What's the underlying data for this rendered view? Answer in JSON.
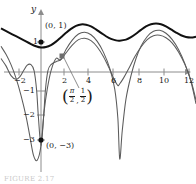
{
  "figure": {
    "caption": "FIGURE 2.17"
  },
  "axes": {
    "y_axis_name": "y",
    "x_ticks": [
      {
        "value": -2,
        "label": "−2",
        "px": 19
      },
      {
        "value": 2,
        "label": "2",
        "px": 64
      },
      {
        "value": 4,
        "label": "4",
        "px": 88
      },
      {
        "value": 6,
        "label": "6",
        "px": 113
      },
      {
        "value": 8,
        "label": "8",
        "px": 139
      },
      {
        "value": 10,
        "label": "10",
        "px": 164
      },
      {
        "value": 12,
        "label": "12",
        "px": 189
      }
    ],
    "y_ticks": [
      {
        "value": 1,
        "label": "1",
        "px": 42
      },
      {
        "value": -1,
        "label": "−1",
        "px": 91
      },
      {
        "value": -2,
        "label": "−2",
        "px": 115
      },
      {
        "value": -3,
        "label": "−3",
        "px": 140
      }
    ],
    "x_axis_y_px": 72,
    "y_axis_x_px": 41
  },
  "annotations": {
    "point_top": {
      "label": "(0, 1)",
      "marker": "filled-circle",
      "x_px": 41,
      "y_px": 42
    },
    "point_bottom": {
      "label": "(0, −3)",
      "marker": "filled-circle",
      "x_px": 41,
      "y_px": 140
    },
    "point_mid": {
      "marker": "filled-square",
      "x_px": 62,
      "y_px": 56,
      "x_num": "π",
      "x_den": "2",
      "y_num": "1",
      "y_den": "2"
    }
  },
  "colors": {
    "curve_thick": "#111111",
    "curve_thin": "#5b5b5b",
    "axis": "#8c8c8c",
    "text": "#1a1a1a"
  },
  "chart_data": {
    "type": "line",
    "title": "",
    "xlabel": "",
    "ylabel": "y",
    "xlim": [
      -3.2,
      12.4
    ],
    "ylim": [
      -3.6,
      2.4
    ],
    "grid": false,
    "legend": null,
    "series": [
      {
        "name": "upper-bounded-oscillating-curve",
        "style": "thick-black",
        "points": [
          [
            -3.2,
            1.78
          ],
          [
            -2.6,
            1.62
          ],
          [
            -2.0,
            1.46
          ],
          [
            -1.4,
            1.3
          ],
          [
            -0.8,
            1.14
          ],
          [
            -0.4,
            1.05
          ],
          [
            0.0,
            1.0
          ],
          [
            0.4,
            1.02
          ],
          [
            0.8,
            1.1
          ],
          [
            1.2,
            1.24
          ],
          [
            1.6,
            1.42
          ],
          [
            2.0,
            1.6
          ],
          [
            2.4,
            1.76
          ],
          [
            2.8,
            1.88
          ],
          [
            3.2,
            1.94
          ],
          [
            3.6,
            1.93
          ],
          [
            4.0,
            1.86
          ],
          [
            4.4,
            1.74
          ],
          [
            4.8,
            1.6
          ],
          [
            5.2,
            1.46
          ],
          [
            5.6,
            1.35
          ],
          [
            6.0,
            1.29
          ],
          [
            6.3,
            1.28
          ],
          [
            6.8,
            1.32
          ],
          [
            7.2,
            1.42
          ],
          [
            7.6,
            1.56
          ],
          [
            8.0,
            1.72
          ],
          [
            8.4,
            1.86
          ],
          [
            8.8,
            1.95
          ],
          [
            9.2,
            1.98
          ],
          [
            9.6,
            1.95
          ],
          [
            10.0,
            1.86
          ],
          [
            10.4,
            1.74
          ],
          [
            10.8,
            1.61
          ],
          [
            11.2,
            1.5
          ],
          [
            11.6,
            1.43
          ],
          [
            12.0,
            1.41
          ],
          [
            12.4,
            1.44
          ]
        ]
      },
      {
        "name": "middle-spiking-curve",
        "style": "thin-gray",
        "points": [
          [
            -3.2,
            1.05
          ],
          [
            -2.8,
            0.72
          ],
          [
            -2.4,
            0.3
          ],
          [
            -2.0,
            -0.25
          ],
          [
            -1.6,
            -0.95
          ],
          [
            -1.2,
            -1.8
          ],
          [
            -0.9,
            -2.6
          ],
          [
            -0.6,
            -3.4
          ],
          [
            -0.3,
            -3.6
          ],
          [
            0.0,
            -3.0
          ],
          [
            0.25,
            -1.6
          ],
          [
            0.5,
            -0.7
          ],
          [
            0.8,
            0.05
          ],
          [
            1.2,
            0.55
          ],
          [
            1.57,
            0.5
          ],
          [
            2.0,
            0.92
          ],
          [
            2.5,
            1.3
          ],
          [
            3.0,
            1.55
          ],
          [
            3.5,
            1.62
          ],
          [
            4.0,
            1.52
          ],
          [
            4.5,
            1.25
          ],
          [
            5.0,
            0.8
          ],
          [
            5.5,
            0.15
          ],
          [
            5.9,
            -0.7
          ],
          [
            6.15,
            -1.9
          ],
          [
            6.3,
            -3.55
          ],
          [
            6.5,
            -2.4
          ],
          [
            6.8,
            -1.1
          ],
          [
            7.2,
            -0.15
          ],
          [
            7.6,
            0.55
          ],
          [
            8.0,
            1.05
          ],
          [
            8.5,
            1.45
          ],
          [
            9.0,
            1.66
          ],
          [
            9.5,
            1.7
          ],
          [
            10.0,
            1.58
          ],
          [
            10.5,
            1.32
          ],
          [
            11.0,
            0.92
          ],
          [
            11.5,
            0.35
          ],
          [
            12.0,
            -0.4
          ],
          [
            12.4,
            -1.3
          ]
        ]
      },
      {
        "name": "lower-spiking-curve",
        "style": "thin-gray",
        "points": [
          [
            -3.2,
            0.55
          ],
          [
            -2.8,
            0.25
          ],
          [
            -2.4,
            -0.15
          ],
          [
            -2.0,
            -0.3
          ],
          [
            -1.7,
            -0.2
          ],
          [
            -1.4,
            0.05
          ],
          [
            -1.1,
            0.28
          ],
          [
            -0.8,
            0.3
          ],
          [
            -0.55,
            0.05
          ],
          [
            -0.35,
            -0.75
          ],
          [
            -0.2,
            -1.9
          ],
          [
            0.0,
            -3.0
          ],
          [
            0.2,
            -1.9
          ],
          [
            0.35,
            -0.75
          ],
          [
            0.55,
            0.05
          ],
          [
            0.8,
            0.3
          ],
          [
            1.2,
            0.42
          ],
          [
            1.57,
            0.5
          ],
          [
            2.0,
            0.78
          ],
          [
            2.5,
            1.1
          ],
          [
            3.0,
            1.32
          ],
          [
            3.5,
            1.38
          ],
          [
            4.0,
            1.28
          ],
          [
            4.5,
            1.02
          ],
          [
            5.0,
            0.62
          ],
          [
            5.5,
            0.1
          ],
          [
            5.9,
            -0.35
          ],
          [
            6.15,
            -0.55
          ],
          [
            6.3,
            -0.48
          ],
          [
            6.6,
            -0.25
          ],
          [
            7.0,
            0.12
          ],
          [
            7.5,
            0.62
          ],
          [
            8.0,
            1.02
          ],
          [
            8.5,
            1.32
          ],
          [
            9.0,
            1.48
          ],
          [
            9.5,
            1.5
          ],
          [
            10.0,
            1.4
          ],
          [
            10.5,
            1.18
          ],
          [
            11.0,
            0.82
          ],
          [
            11.5,
            0.32
          ],
          [
            12.0,
            -0.35
          ],
          [
            12.4,
            -1.15
          ]
        ]
      }
    ]
  }
}
